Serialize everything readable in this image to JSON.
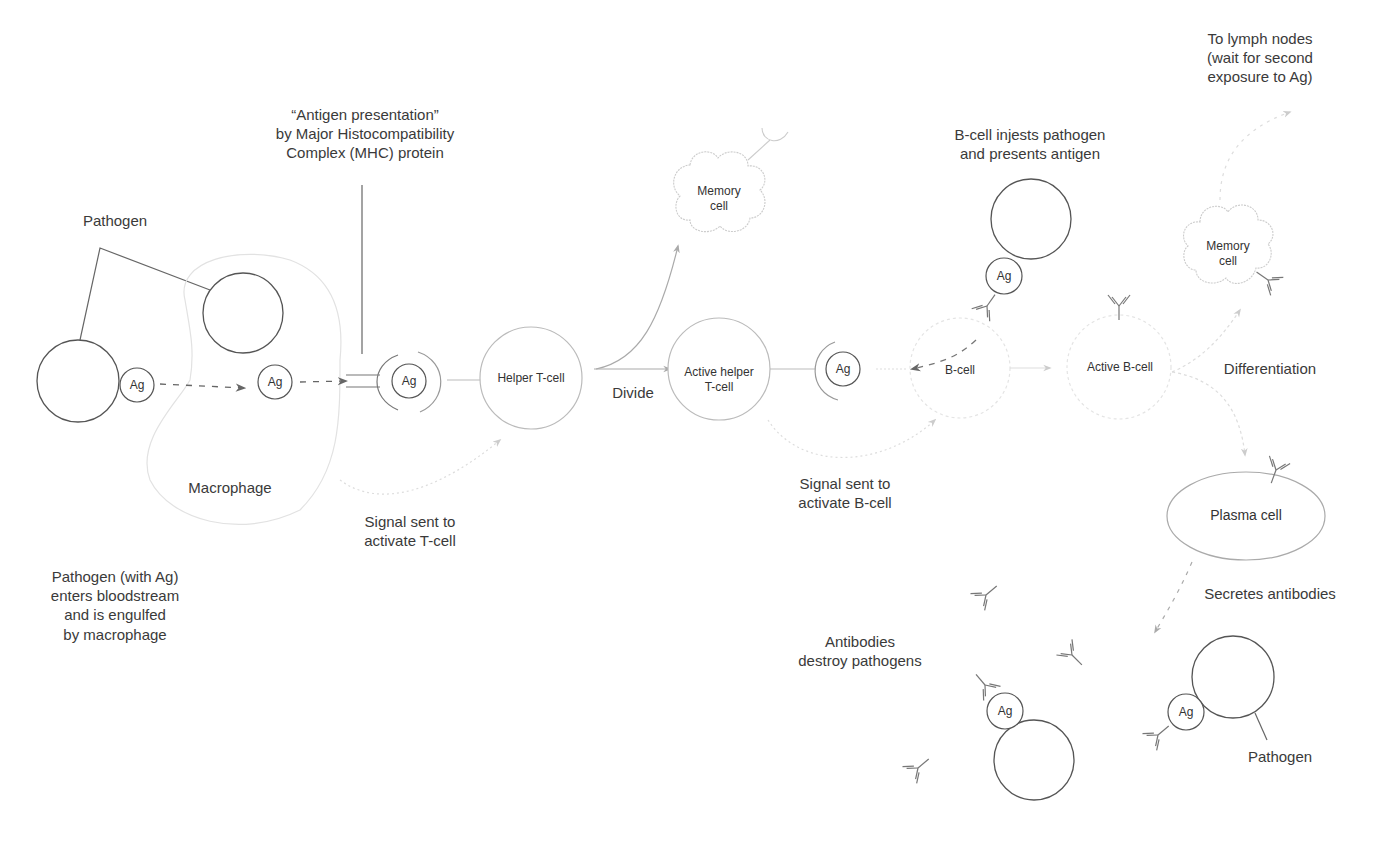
{
  "labels": {
    "pathogen_top": "Pathogen",
    "antigen_presentation": "“Antigen presentation”\nby Major Histocompatibility\nComplex (MHC) protein",
    "macrophage": "Macrophage",
    "step1_caption": "Pathogen (with Ag)\nenters bloodstream\nand is engulfed\nby macrophage",
    "signal_t": "Signal sent to\nactivate T-cell",
    "divide": "Divide",
    "signal_b": "Signal sent to\nactivate B-cell",
    "b_ingests": "B-cell injests pathogen\nand presents antigen",
    "lymph": "To lymph nodes\n(wait for second\nexposure to Ag)",
    "differentiation": "Differentiation",
    "secretes": "Secretes antibodies",
    "antibodies_destroy": "Antibodies\ndestroy pathogens",
    "pathogen_bottom": "Pathogen"
  },
  "cells": {
    "helper_t": "Helper T-cell",
    "active_helper_t": "Active helper\nT-cell",
    "memory_top": "Memory\ncell",
    "b_cell": "B-cell",
    "active_b": "Active B-cell",
    "memory_right": "Memory\ncell",
    "plasma": "Plasma cell"
  },
  "antigen_tag": "Ag",
  "colors": {
    "stroke_dark": "#555555",
    "stroke_light": "#bbbbbb",
    "stroke_faint": "#dddddd",
    "arrow": "#777777",
    "text": "#3a3a3a"
  }
}
